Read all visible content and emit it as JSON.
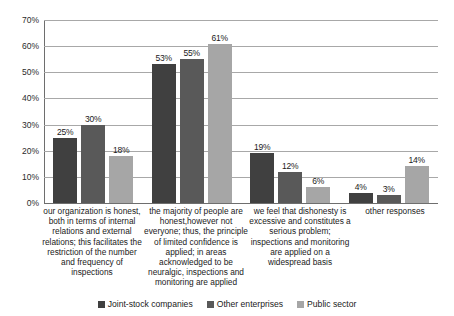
{
  "chart_data": {
    "type": "bar",
    "title": "",
    "subtitle": "",
    "xlabel": "",
    "ylabel": "",
    "ylim": [
      0,
      70
    ],
    "ytick_labels": [
      "0%",
      "10%",
      "20%",
      "30%",
      "40%",
      "50%",
      "60%",
      "70%"
    ],
    "ytick_values": [
      0,
      10,
      20,
      30,
      40,
      50,
      60,
      70
    ],
    "grid": true,
    "legend_position": "bottom",
    "value_suffix": "%",
    "categories": [
      "our organization is honest, both in terms of internal relations and external relations; this facilitates the restriction of the number and frequency of inspections",
      "the majority of people are honest,however not everyone; thus, the principle of limited confidence is applied; in areas acknowledged to be neuralgic, inspections and monitoring are applied",
      "we feel that dishonesty is excessive and constitutes a serious problem; inspections and monitoring are applied on a widespread basis",
      "other responses"
    ],
    "series": [
      {
        "name": "Joint-stock companies",
        "color": "#404040",
        "values": [
          25,
          53,
          19,
          4
        ],
        "labels": [
          "25%",
          "53%",
          "19%",
          "4%"
        ]
      },
      {
        "name": "Other enterprises",
        "color": "#595959",
        "values": [
          30,
          55,
          12,
          3
        ],
        "labels": [
          "30%",
          "55%",
          "12%",
          "3%"
        ]
      },
      {
        "name": "Public sector",
        "color": "#a6a6a6",
        "values": [
          18,
          61,
          6,
          14
        ],
        "labels": [
          "18%",
          "61%",
          "6%",
          "14%"
        ]
      }
    ]
  },
  "colors": {
    "gridline": "#a8a8a8",
    "axis": "#6e6e6e",
    "text": "#1a1a1a",
    "background": "#ffffff"
  }
}
